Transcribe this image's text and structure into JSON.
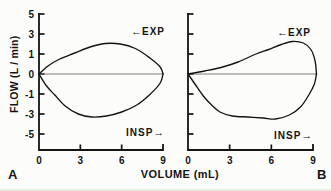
{
  "figure": {
    "background": "#fcfcfa",
    "ink": "#141414",
    "zero_line_color": "#6e6e6e"
  },
  "axes": {
    "y_label": "FLOW (L / min)",
    "x_label": "VOLUME (mL)"
  },
  "panels": [
    {
      "label": "A",
      "exp_arrow": "←",
      "exp_label": "EXP",
      "insp_label": "INSP",
      "insp_arrow": "→",
      "show_y_tick_labels": true
    },
    {
      "label": "B",
      "exp_arrow": "←",
      "exp_label": "EXP",
      "insp_label": "INSP",
      "insp_arrow": "→",
      "show_y_tick_labels": false
    }
  ],
  "chart_data": [
    {
      "type": "line",
      "title": "A",
      "xlabel": "VOLUME (mL)",
      "ylabel": "FLOW (L / min)",
      "xlim": [
        0,
        9
      ],
      "ylim": [
        -5,
        5
      ],
      "x_ticks": [
        0,
        3,
        6,
        9
      ],
      "y_ticks": [
        5,
        3,
        1,
        0,
        -1,
        -3,
        -5
      ],
      "grid": false,
      "legend": "none",
      "annotations": [
        "← EXP (expiration, upper loop)",
        "INSP → (inspiration, lower loop)"
      ],
      "series": [
        {
          "name": "expiratory-limb",
          "points": [
            [
              0,
              0
            ],
            [
              0.65,
              0.4
            ],
            [
              1.5,
              0.75
            ],
            [
              2.6,
              1.1
            ],
            [
              3.7,
              1.7
            ],
            [
              4.8,
              2.05
            ],
            [
              5.9,
              2.0
            ],
            [
              7.0,
              1.55
            ],
            [
              8.05,
              0.8
            ],
            [
              8.8,
              0.35
            ],
            [
              9,
              0
            ]
          ]
        },
        {
          "name": "inspiratory-limb",
          "points": [
            [
              0,
              0
            ],
            [
              0.55,
              -0.6
            ],
            [
              1.15,
              -1.1
            ],
            [
              1.9,
              -2.2
            ],
            [
              2.85,
              -3.0
            ],
            [
              3.85,
              -3.3
            ],
            [
              4.9,
              -3.2
            ],
            [
              6.0,
              -2.8
            ],
            [
              7.1,
              -2.1
            ],
            [
              8.05,
              -1.05
            ],
            [
              8.8,
              -0.45
            ],
            [
              9,
              0
            ]
          ]
        },
        {
          "name": "zero-flow-line",
          "points": [
            [
              0,
              0
            ],
            [
              9,
              0
            ]
          ]
        }
      ]
    },
    {
      "type": "line",
      "title": "B",
      "xlabel": "VOLUME (mL)",
      "ylabel": "FLOW (L / min)",
      "xlim": [
        0,
        9
      ],
      "ylim": [
        -5,
        5
      ],
      "x_ticks": [
        0,
        3,
        6,
        9
      ],
      "y_ticks": [
        5,
        3,
        1,
        0,
        -1,
        -3,
        -5
      ],
      "grid": false,
      "legend": "none",
      "annotations": [
        "← EXP (expiration, upper loop)",
        "INSP → (inspiration, lower loop)"
      ],
      "series": [
        {
          "name": "expiratory-limb",
          "points": [
            [
              0,
              0
            ],
            [
              1.2,
              0.15
            ],
            [
              2.5,
              0.35
            ],
            [
              3.6,
              0.6
            ],
            [
              4.9,
              1.0
            ],
            [
              5.8,
              1.45
            ],
            [
              6.7,
              1.95
            ],
            [
              7.5,
              2.25
            ],
            [
              8.3,
              2.1
            ],
            [
              8.85,
              1.45
            ],
            [
              9.15,
              0.65
            ],
            [
              9.25,
              0
            ]
          ]
        },
        {
          "name": "inspiratory-limb",
          "points": [
            [
              0,
              0
            ],
            [
              0.5,
              -0.5
            ],
            [
              1.1,
              -1.2
            ],
            [
              1.7,
              -2.1
            ],
            [
              2.3,
              -2.8
            ],
            [
              3.2,
              -3.2
            ],
            [
              4.3,
              -3.3
            ],
            [
              5.4,
              -3.4
            ],
            [
              6.3,
              -3.5
            ],
            [
              7.3,
              -3.1
            ],
            [
              8.1,
              -2.3
            ],
            [
              8.7,
              -1.1
            ],
            [
              9.1,
              -0.5
            ],
            [
              9.25,
              0
            ]
          ]
        },
        {
          "name": "zero-flow-line",
          "points": [
            [
              0,
              0
            ],
            [
              9.25,
              0
            ]
          ]
        }
      ]
    }
  ]
}
